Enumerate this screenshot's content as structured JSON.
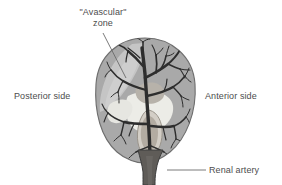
{
  "figure": {
    "background_color": "#ffffff",
    "text_color": "#4d4d4d"
  },
  "labels": {
    "avascular_line1": "\"Avascular\"",
    "avascular_line2": "zone",
    "posterior": "Posterior side",
    "anterior": "Anterior side",
    "renal_artery": "Renal artery"
  },
  "anatomy": {
    "kidney_parenchyma": {
      "name": "kidney-parenchyma",
      "fill": "#a9a9a9",
      "stroke": "#6f6f6f"
    },
    "avascular_zone": {
      "name": "avascular-zone",
      "fill": "#c9c9c9",
      "description": "Lighter wedge of relatively avascular parenchyma along the posterolateral border"
    },
    "renal_sinus": {
      "name": "renal-sinus",
      "fill": "#ebebe6",
      "description": "Pale renal sinus and calyceal space at the hilum"
    },
    "medullary_pyramid": {
      "name": "medullary-pyramid",
      "fill": "#b5b0a8",
      "description": "Shaded pyramid projecting into the sinus"
    },
    "arterial_tree": {
      "name": "renal-arterial-tree",
      "stroke": "#2f2f2f",
      "description": "Segmental, interlobar and arcuate branches arborising into the cortex"
    },
    "renal_artery_stem": {
      "name": "renal-artery-stem",
      "fill": "#5d5a57",
      "stroke": "#3a3a3a"
    }
  },
  "leader_lines": {
    "avascular": {
      "name": "avascular-leader-line",
      "from": [
        103,
        33
      ],
      "to": [
        126,
        78
      ],
      "stroke": "#6b6b6b"
    },
    "renal_artery": {
      "name": "renal-artery-leader-line",
      "from": [
        167,
        170
      ],
      "to": [
        206,
        170
      ],
      "stroke": "#6b6b6b"
    }
  }
}
